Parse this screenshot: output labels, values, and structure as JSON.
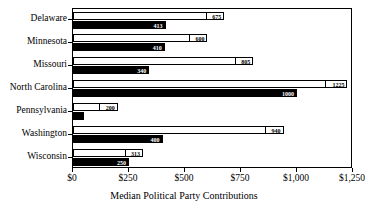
{
  "chart_data": {
    "type": "bar",
    "orientation": "horizontal",
    "title": "",
    "xlabel": "Median Political Party Contributions",
    "ylabel": "",
    "xlim": [
      0,
      1250
    ],
    "grid": false,
    "legend": false,
    "categories": [
      "Delaware",
      "Minnesota",
      "Missouri",
      "North Carolina",
      "Pennsylvania",
      "Washington",
      "Wisconsin"
    ],
    "tick_labels": [
      "$0",
      "$250",
      "$500",
      "$750",
      "$1,000",
      "$1,250"
    ],
    "tick_values": [
      0,
      250,
      500,
      750,
      1000,
      1250
    ],
    "series": [
      {
        "name": "upper-bar",
        "style": "white-outline",
        "color": "#ffffff",
        "values": [
          675,
          600,
          805,
          1225,
          200,
          940,
          313
        ],
        "labels": [
          "675",
          "600",
          "805",
          "1225",
          "200",
          "940",
          "313"
        ]
      },
      {
        "name": "lower-bar",
        "style": "black-filled",
        "color": "#000000",
        "values": [
          413,
          410,
          340,
          1000,
          50,
          400,
          250
        ],
        "labels": [
          "413",
          "410",
          "340",
          "1000",
          "",
          "400",
          "250"
        ]
      }
    ]
  }
}
